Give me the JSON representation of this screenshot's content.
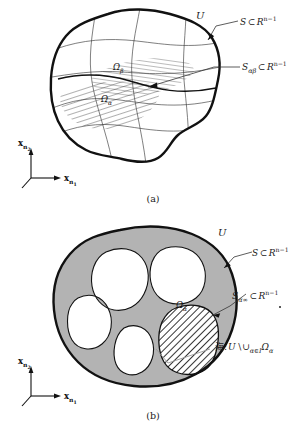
{
  "figure": {
    "title_hidden": "",
    "panels": [
      {
        "id": "a",
        "caption": "(a)",
        "region_symbol": "U",
        "labels": {
          "boundary_surface": "S",
          "boundary_surface_subset": "⊂",
          "boundary_surface_space": "R",
          "boundary_surface_exp": "n−1",
          "interface_surface": "S",
          "interface_surface_sub": "αβ",
          "interface_subset": "⊂",
          "interface_space": "R",
          "interface_exp": "n−1",
          "omega_beta": "Ω",
          "omega_beta_sub": "β",
          "omega_alpha": "Ω",
          "omega_alpha_sub": "α"
        },
        "axes": {
          "vertical": "x",
          "vertical_sub": "n",
          "vertical_subsub": "2",
          "horizontal": "x",
          "horizontal_sub": "n",
          "horizontal_subsub": "1"
        }
      },
      {
        "id": "b",
        "caption": "(b)",
        "region_symbol": "U",
        "labels": {
          "boundary_surface": "S",
          "boundary_surface_subset": "⊂",
          "boundary_surface_space": "R",
          "boundary_surface_exp": "n−1",
          "interface_surface": "S",
          "interface_surface_sub": "α∞",
          "interface_subset": "⊂",
          "interface_space": "R",
          "interface_exp": "n−1",
          "omega_alpha": "Ω",
          "omega_alpha_sub": "α",
          "sea_label_cjk": "海",
          "sea_label_colon": ":",
          "sea_label_U": "U",
          "sea_label_setminus": "\\",
          "sea_label_union": "∪",
          "sea_label_union_sub": "α∈I",
          "sea_label_omega": "Ω",
          "sea_label_omega_sub": "α"
        },
        "axes": {
          "vertical": "x",
          "vertical_sub": "n",
          "vertical_subsub": "2",
          "horizontal": "x",
          "horizontal_sub": "n",
          "horizontal_subsub": "1"
        }
      }
    ],
    "colors": {
      "ink": "#111111",
      "line": "#333333",
      "hatch": "#1a1a1a",
      "sea_fill": "#b3b3b3",
      "hole_fill": "#ffffff",
      "background": "#ffffff"
    }
  }
}
